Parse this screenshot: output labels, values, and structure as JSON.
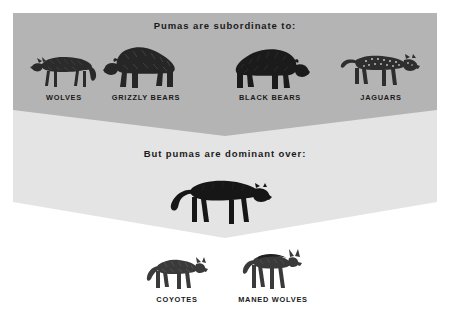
{
  "poster": {
    "heading_top": "Pumas are subordinate to:",
    "heading_bottom": "But pumas are dominant over:",
    "colors": {
      "background": "#ffffff",
      "band_upper": "#b4b4b4",
      "band_lower": "#e4e4e4",
      "text": "#1a1a1a",
      "figure_dark": "#1d1d1d",
      "figure_mid": "#4a4a4a"
    }
  },
  "subordinate_row": {
    "items": [
      {
        "label": "WOLVES",
        "icon": "wolf-figure",
        "facing": "left",
        "x": 30,
        "y": 46,
        "w": 68,
        "h": 44,
        "label_x": 28,
        "label_y": 93,
        "label_w": 72
      },
      {
        "label": "GRIZZLY BEARS",
        "icon": "grizzly-bear-figure",
        "facing": "left",
        "x": 103,
        "y": 38,
        "w": 84,
        "h": 52,
        "label_x": 101,
        "label_y": 93,
        "label_w": 90
      },
      {
        "label": "BLACK BEARS",
        "icon": "black-bear-figure",
        "facing": "right",
        "x": 228,
        "y": 41,
        "w": 82,
        "h": 49,
        "label_x": 226,
        "label_y": 93,
        "label_w": 88
      },
      {
        "label": "JAGUARS",
        "icon": "jaguar-figure",
        "facing": "right",
        "x": 340,
        "y": 44,
        "w": 82,
        "h": 46,
        "label_x": 344,
        "label_y": 93,
        "label_w": 74
      }
    ]
  },
  "dominant_section": {
    "puma": {
      "label": "",
      "icon": "puma-figure",
      "facing": "right",
      "x": 168,
      "y": 172,
      "w": 104,
      "h": 56
    },
    "items": [
      {
        "label": "COYOTES",
        "icon": "coyote-figure",
        "facing": "right",
        "x": 146,
        "y": 250,
        "w": 62,
        "h": 42,
        "label_x": 140,
        "label_y": 295,
        "label_w": 74
      },
      {
        "label": "MANED WOLVES",
        "icon": "maned-wolf-figure",
        "facing": "right",
        "x": 240,
        "y": 246,
        "w": 62,
        "h": 46,
        "label_x": 228,
        "label_y": 295,
        "label_w": 90
      }
    ]
  },
  "band_geometry": {
    "upper": {
      "left": 13,
      "right": 437,
      "top": 13,
      "edge_bottom": 110,
      "apex_y": 136,
      "apex_x": 225
    },
    "lower": {
      "left": 13,
      "right": 437,
      "edge_bottom": 202,
      "apex_y": 238,
      "apex_x": 225
    }
  }
}
